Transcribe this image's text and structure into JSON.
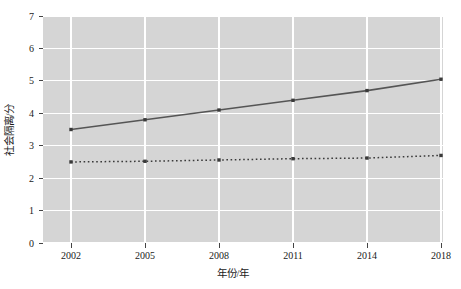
{
  "chart_data": {
    "type": "line",
    "title": "",
    "xlabel": "年份/年",
    "ylabel": "社会隔离/分",
    "categories": [
      "2002",
      "2005",
      "2008",
      "2011",
      "2014",
      "2018"
    ],
    "x": [
      2002,
      2005,
      2008,
      2011,
      2014,
      2018
    ],
    "series": [
      {
        "name": "实线",
        "style": "solid",
        "marker": "square",
        "color": "#555555",
        "values": [
          3.5,
          3.8,
          4.1,
          4.4,
          4.7,
          5.05
        ]
      },
      {
        "name": "虚线",
        "style": "dotted",
        "marker": "square",
        "color": "#3a3a3a",
        "values": [
          2.5,
          2.52,
          2.56,
          2.6,
          2.62,
          2.7
        ]
      }
    ],
    "ylim": [
      0,
      7
    ],
    "yticks": [
      "0",
      "1",
      "2",
      "3",
      "4",
      "5",
      "6",
      "7"
    ],
    "xticks": [
      "2002",
      "2005",
      "2008",
      "2011",
      "2014",
      "2018"
    ],
    "grid": true,
    "grid_color": "#ffffff",
    "plot_background": "#d5d5d5",
    "figure_background": "#ffffff",
    "legend": "none"
  },
  "axes": {
    "y_title": "社会隔离/分",
    "x_title": "年份/年",
    "y_tick_labels": [
      "7",
      "6",
      "5",
      "4",
      "3",
      "2",
      "1",
      "0"
    ],
    "x_tick_labels": [
      "2002",
      "2005",
      "2008",
      "2011",
      "2014",
      "2018"
    ]
  }
}
